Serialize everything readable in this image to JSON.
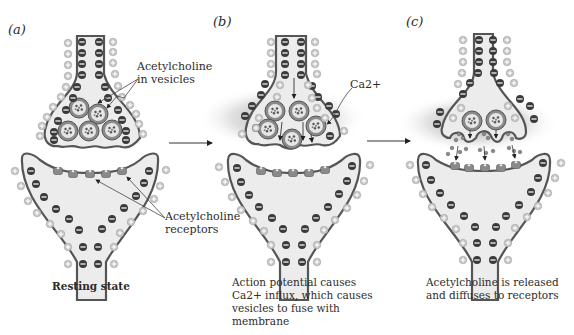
{
  "panels": [
    {
      "id": "a",
      "label": "(a)",
      "caption_lines": [
        "Resting state"
      ],
      "callouts": {
        "vesicles": [
          "Acetylcholine",
          "in vesicles"
        ],
        "receptors": [
          "Acetylcholine",
          "receptors"
        ]
      }
    },
    {
      "id": "b",
      "label": "(b)",
      "caption_lines": [
        "Action potential causes",
        "Ca2+ influx, which causes",
        "vesicles to fuse with",
        "membrane"
      ],
      "callouts": {
        "calcium": "Ca2+"
      }
    },
    {
      "id": "c",
      "label": "(c)",
      "caption_lines": [
        "Acetylcholine is released",
        "and diffuses to receptors"
      ]
    }
  ],
  "colors": {
    "membrane": "#555555",
    "cytoplasm": "#ececec",
    "negative_ion": "#3a3a3a",
    "positive_ion": "#b9b9b9",
    "receptor": "#8a8a8a",
    "glow": "#9a9a9a"
  }
}
